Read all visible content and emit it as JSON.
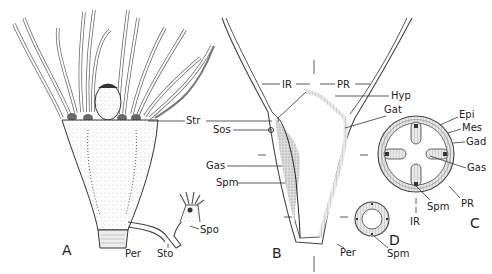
{
  "figure": {
    "panels": [
      {
        "id": "A",
        "label": "A",
        "description": "External view of polyp with tentacles and stolon"
      },
      {
        "id": "B",
        "label": "B",
        "description": "Longitudinal section"
      },
      {
        "id": "C",
        "label": "C",
        "description": "Cross section through gastric region"
      },
      {
        "id": "D",
        "label": "D",
        "description": "Cross section through lower stalk"
      }
    ],
    "labels": {
      "str": "Str",
      "sos": "Sos",
      "gas_b": "Gas",
      "spm_b": "Spm",
      "spo": "Spo",
      "per_a": "Per",
      "sto": "Sto",
      "ir_top": "IR",
      "pr_top": "PR",
      "hyp": "Hyp",
      "gat": "Gat",
      "epi": "Epi",
      "mes": "Mes",
      "gad": "Gad",
      "gas_c": "Gas",
      "spm_c": "Spm",
      "pr_c": "PR",
      "ir_c": "IR",
      "per_b": "Per",
      "spm_d": "Spm"
    }
  }
}
